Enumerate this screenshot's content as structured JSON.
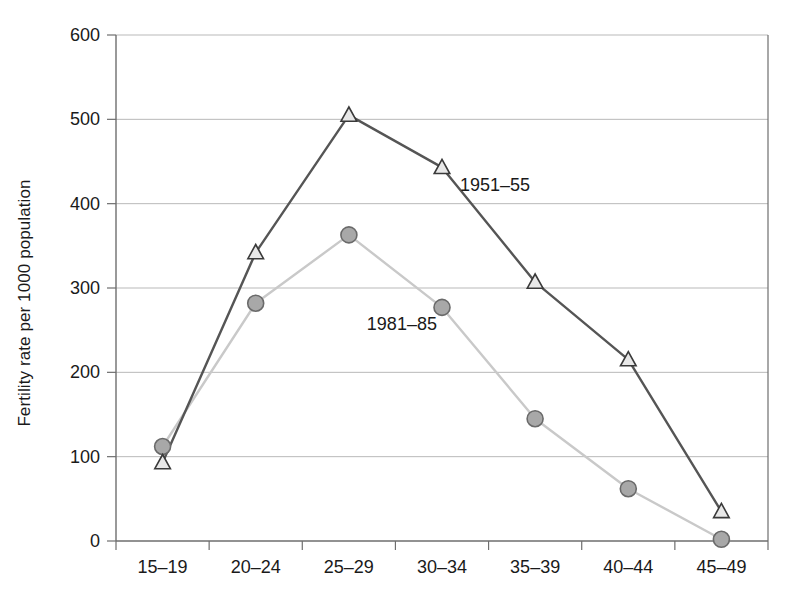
{
  "chart_data": {
    "type": "line",
    "title": "",
    "subtitle": "",
    "xlabel": "",
    "ylabel": "Fertility rate per 1000 population",
    "categories": [
      "15–19",
      "20–24",
      "25–29",
      "30–34",
      "35–39",
      "40–44",
      "45–49"
    ],
    "ylim": [
      0,
      600
    ],
    "yticks": [
      0,
      100,
      200,
      300,
      400,
      500,
      600
    ],
    "ytick_labels": [
      "0",
      "100",
      "200",
      "300",
      "400",
      "500",
      "600"
    ],
    "grid": "horizontal",
    "legend_position": "inline-annotations",
    "series": [
      {
        "name": "1951–55",
        "values": [
          93,
          342,
          505,
          443,
          307,
          215,
          35
        ],
        "color": "#555555",
        "marker": "triangle",
        "marker_fill": "#e8e8e8",
        "marker_stroke": "#3a3a3a",
        "annotation": {
          "text": "1951–55",
          "category": "30–34",
          "value": 415
        }
      },
      {
        "name": "1981–85",
        "values": [
          112,
          282,
          363,
          277,
          145,
          62,
          2
        ],
        "color": "#c9c9c9",
        "marker": "circle",
        "marker_fill": "#a8a8a8",
        "marker_stroke": "#6a6a6a",
        "annotation": {
          "text": "1981–85",
          "category": "25–29",
          "value": 250
        }
      }
    ],
    "axis_color": "#6e6e6e",
    "grid_color": "#b9b9b9",
    "background": "#ffffff"
  },
  "annotations": {
    "series_1_label": "1951–55",
    "series_2_label": "1981–85"
  }
}
